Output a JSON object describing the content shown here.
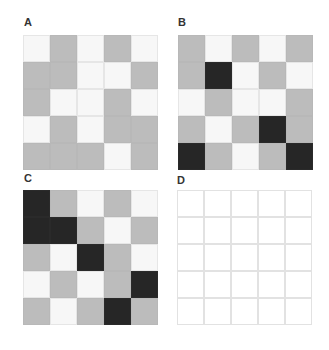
{
  "panels": [
    {
      "label": "A",
      "rows": [
        [
          "W",
          "G",
          "W",
          "G",
          "W"
        ],
        [
          "G",
          "G",
          "W",
          "W",
          "G"
        ],
        [
          "G",
          "W",
          "W",
          "G",
          "W"
        ],
        [
          "W",
          "G",
          "W",
          "G",
          "G"
        ],
        [
          "G",
          "G",
          "G",
          "W",
          "G"
        ]
      ]
    },
    {
      "label": "B",
      "rows": [
        [
          "G",
          "W",
          "G",
          "W",
          "G"
        ],
        [
          "G",
          "D",
          "W",
          "G",
          "W"
        ],
        [
          "W",
          "G",
          "W",
          "W",
          "G"
        ],
        [
          "G",
          "W",
          "G",
          "D",
          "G"
        ],
        [
          "D",
          "G",
          "W",
          "G",
          "D"
        ]
      ]
    },
    {
      "label": "C",
      "rows": [
        [
          "D",
          "G",
          "W",
          "G",
          "W"
        ],
        [
          "D",
          "D",
          "G",
          "W",
          "G"
        ],
        [
          "G",
          "W",
          "D",
          "G",
          "W"
        ],
        [
          "W",
          "G",
          "W",
          "G",
          "D"
        ],
        [
          "G",
          "W",
          "G",
          "D",
          "G"
        ]
      ]
    },
    {
      "label": "D",
      "rows": [
        [
          "E",
          "E",
          "E",
          "E",
          "E"
        ],
        [
          "E",
          "E",
          "E",
          "E",
          "E"
        ],
        [
          "E",
          "E",
          "E",
          "E",
          "E"
        ],
        [
          "E",
          "E",
          "E",
          "E",
          "E"
        ],
        [
          "E",
          "E",
          "E",
          "E",
          "E"
        ]
      ]
    }
  ],
  "legend": {
    "W": "white cell",
    "G": "gray cell",
    "D": "dark cell",
    "E": "empty cell"
  },
  "colors": {
    "white": "#f7f7f7",
    "gray": "#bcbcbc",
    "dark": "#262626",
    "empty": "#ffffff"
  }
}
